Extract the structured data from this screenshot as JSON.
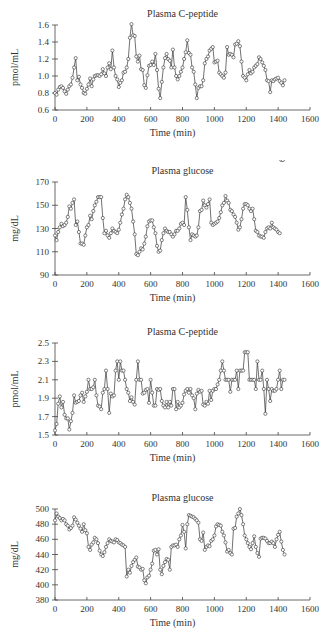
{
  "chart_data": [
    {
      "type": "line",
      "title": "Plasma C-peptide",
      "xlabel": "Time (min)",
      "ylabel": "pmol/mL",
      "xlim": [
        0,
        1600
      ],
      "ylim": [
        0.6,
        1.6
      ],
      "xticks": [
        0,
        200,
        400,
        600,
        800,
        1000,
        1200,
        1400,
        1600
      ],
      "yticks": [
        0.6,
        0.8,
        1.0,
        1.2,
        1.4,
        1.6
      ],
      "ytick_labels": [
        "0.6",
        "0.8",
        "1.0",
        "1.2",
        "1.4",
        "1.6"
      ],
      "grid": false,
      "marker": "open-circle",
      "x": [
        0,
        10,
        20,
        30,
        40,
        50,
        60,
        70,
        80,
        90,
        100,
        110,
        120,
        130,
        140,
        150,
        160,
        170,
        180,
        190,
        200,
        210,
        220,
        230,
        240,
        250,
        260,
        270,
        280,
        290,
        300,
        310,
        320,
        330,
        340,
        350,
        360,
        370,
        380,
        390,
        400,
        410,
        420,
        430,
        440,
        450,
        460,
        470,
        480,
        490,
        500,
        510,
        520,
        530,
        540,
        550,
        560,
        570,
        580,
        590,
        600,
        610,
        620,
        630,
        640,
        650,
        660,
        670,
        680,
        690,
        700,
        710,
        720,
        730,
        740,
        750,
        760,
        770,
        780,
        790,
        800,
        810,
        820,
        830,
        840,
        850,
        860,
        870,
        880,
        890,
        900,
        910,
        920,
        930,
        940,
        950,
        960,
        970,
        980,
        990,
        1000,
        1010,
        1020,
        1030,
        1040,
        1050,
        1060,
        1070,
        1080,
        1090,
        1100,
        1110,
        1120,
        1130,
        1140,
        1150,
        1160,
        1170,
        1180,
        1190,
        1200,
        1210,
        1220,
        1230,
        1240,
        1250,
        1260,
        1270,
        1280,
        1290,
        1300,
        1310,
        1320,
        1330,
        1340,
        1350,
        1360,
        1370,
        1380,
        1390,
        1400,
        1410,
        1420,
        1430,
        1440
      ],
      "values": [
        0.8,
        0.78,
        0.84,
        0.87,
        0.88,
        0.86,
        0.82,
        0.79,
        0.84,
        0.88,
        0.9,
        0.98,
        1.1,
        1.21,
        0.95,
        0.99,
        0.9,
        0.86,
        0.8,
        0.79,
        0.85,
        0.9,
        0.97,
        0.88,
        0.96,
        1.0,
        1.01,
        1.01,
        1.0,
        1.02,
        1.08,
        1.03,
        1.0,
        1.1,
        1.15,
        1.08,
        1.3,
        1.1,
        1.0,
        0.96,
        0.87,
        0.92,
        0.95,
        1.04,
        1.05,
        1.1,
        1.2,
        1.45,
        1.61,
        1.48,
        1.47,
        1.23,
        1.17,
        1.24,
        1.08,
        1.07,
        0.89,
        0.86,
        1.01,
        1.12,
        1.13,
        1.17,
        1.13,
        1.26,
        1.07,
        0.85,
        0.74,
        0.93,
        1.1,
        1.21,
        1.26,
        1.2,
        1.18,
        1.1,
        1.31,
        1.1,
        1.0,
        0.96,
        1.0,
        1.05,
        1.1,
        1.2,
        1.28,
        1.42,
        1.27,
        1.25,
        1.1,
        1.05,
        0.9,
        0.74,
        0.86,
        0.88,
        0.88,
        0.95,
        1.15,
        1.2,
        1.23,
        1.3,
        1.32,
        1.34,
        1.16,
        1.17,
        1.18,
        1.04,
        1.02,
        1.0,
        0.98,
        1.04,
        1.34,
        1.25,
        1.26,
        1.25,
        1.22,
        1.37,
        1.38,
        1.41,
        1.35,
        1.17,
        1.0,
        0.98,
        0.95,
        1.02,
        1.07,
        1.03,
        1.05,
        1.1,
        1.12,
        1.14,
        1.22,
        1.2,
        1.16,
        1.12,
        1.07,
        0.95,
        0.94,
        0.81,
        0.95,
        0.94,
        0.96,
        0.97,
        0.98,
        0.94,
        0.92,
        0.89,
        0.95
      ]
    },
    {
      "type": "line",
      "title": "Plasma glucose",
      "xlabel": "Time (min)",
      "ylabel": "mg/dL",
      "xlim": [
        0,
        1600
      ],
      "ylim": [
        90,
        170
      ],
      "xticks": [
        0,
        200,
        400,
        600,
        800,
        1000,
        1200,
        1400,
        1600
      ],
      "yticks": [
        90,
        110,
        130,
        150,
        170
      ],
      "ytick_labels": [
        "90",
        "110",
        "130",
        "150",
        "170"
      ],
      "grid": false,
      "marker": "open-circle",
      "x": [
        0,
        10,
        20,
        30,
        40,
        50,
        60,
        70,
        80,
        90,
        100,
        110,
        120,
        130,
        140,
        150,
        160,
        170,
        180,
        190,
        200,
        210,
        220,
        230,
        240,
        250,
        260,
        270,
        280,
        290,
        300,
        310,
        320,
        330,
        340,
        350,
        360,
        370,
        380,
        390,
        400,
        410,
        420,
        430,
        440,
        450,
        460,
        470,
        480,
        490,
        500,
        510,
        520,
        530,
        540,
        550,
        560,
        570,
        580,
        590,
        600,
        610,
        620,
        630,
        640,
        650,
        660,
        670,
        680,
        690,
        700,
        710,
        720,
        730,
        740,
        750,
        760,
        770,
        780,
        790,
        800,
        810,
        820,
        830,
        840,
        850,
        860,
        870,
        880,
        890,
        900,
        910,
        920,
        930,
        940,
        950,
        960,
        970,
        980,
        990,
        1000,
        1010,
        1020,
        1030,
        1040,
        1050,
        1060,
        1070,
        1080,
        1090,
        1100,
        1110,
        1120,
        1130,
        1140,
        1150,
        1160,
        1170,
        1180,
        1190,
        1200,
        1210,
        1220,
        1230,
        1240,
        1250,
        1260,
        1270,
        1280,
        1290,
        1300,
        1310,
        1320,
        1330,
        1340,
        1350,
        1360,
        1370,
        1380,
        1390,
        1400,
        1410,
        1420,
        1430
      ],
      "values": [
        124,
        120,
        127,
        131,
        134,
        132,
        133,
        135,
        140,
        149,
        147,
        152,
        155,
        133,
        136,
        127,
        117,
        117,
        116,
        124,
        131,
        133,
        141,
        138,
        145,
        150,
        153,
        157,
        157,
        157,
        139,
        126,
        128,
        124,
        122,
        126,
        130,
        128,
        127,
        126,
        129,
        135,
        142,
        147,
        155,
        159,
        157,
        152,
        147,
        136,
        125,
        108,
        107,
        110,
        113,
        112,
        117,
        123,
        132,
        136,
        137,
        137,
        131,
        126,
        115,
        110,
        111,
        120,
        126,
        130,
        128,
        127,
        127,
        125,
        123,
        125,
        128,
        128,
        130,
        134,
        135,
        133,
        157,
        146,
        131,
        120,
        125,
        124,
        123,
        124,
        131,
        145,
        146,
        154,
        150,
        148,
        151,
        155,
        135,
        133,
        134,
        135,
        136,
        139,
        144,
        150,
        152,
        158,
        154,
        152,
        146,
        145,
        142,
        140,
        135,
        129,
        131,
        138,
        147,
        151,
        151,
        150,
        147,
        145,
        147,
        138,
        128,
        127,
        124,
        123,
        123,
        122,
        127,
        130,
        131,
        130,
        135,
        131,
        130,
        129,
        127,
        126
      ]
    },
    {
      "type": "line",
      "title": "Plasma C-peptide",
      "xlabel": "Time (min)",
      "ylabel": "pmol/mL",
      "xlim": [
        0,
        1600
      ],
      "ylim": [
        1.5,
        2.5
      ],
      "xticks": [
        0,
        200,
        400,
        600,
        800,
        1000,
        1200,
        1400,
        1600
      ],
      "yticks": [
        1.5,
        1.7,
        1.9,
        2.1,
        2.3,
        2.5
      ],
      "ytick_labels": [
        "1.5",
        "1.7",
        "1.9",
        "2.1",
        "2.3",
        "2.5"
      ],
      "grid": false,
      "marker": "open-circle",
      "x": [
        0,
        10,
        20,
        30,
        40,
        50,
        60,
        70,
        80,
        90,
        100,
        110,
        120,
        130,
        140,
        150,
        160,
        170,
        180,
        190,
        200,
        210,
        220,
        230,
        240,
        250,
        260,
        270,
        280,
        290,
        300,
        310,
        320,
        330,
        340,
        350,
        360,
        370,
        380,
        390,
        400,
        410,
        420,
        430,
        440,
        450,
        460,
        470,
        480,
        490,
        500,
        510,
        520,
        530,
        540,
        550,
        560,
        570,
        580,
        590,
        600,
        610,
        620,
        630,
        640,
        650,
        660,
        670,
        680,
        690,
        700,
        710,
        720,
        730,
        740,
        750,
        760,
        770,
        780,
        790,
        800,
        810,
        820,
        830,
        840,
        850,
        860,
        870,
        880,
        890,
        900,
        910,
        920,
        930,
        940,
        950,
        960,
        970,
        980,
        990,
        1000,
        1010,
        1020,
        1030,
        1040,
        1050,
        1060,
        1070,
        1080,
        1090,
        1100,
        1110,
        1120,
        1130,
        1140,
        1150,
        1160,
        1170,
        1180,
        1190,
        1200,
        1210,
        1220,
        1230,
        1240,
        1250,
        1260,
        1270,
        1280,
        1290,
        1300,
        1310,
        1320,
        1330,
        1340,
        1350,
        1360,
        1370,
        1380,
        1390,
        1400,
        1410,
        1420,
        1430,
        1440
      ],
      "values": [
        1.55,
        1.62,
        1.84,
        1.92,
        1.8,
        1.86,
        1.72,
        1.68,
        1.68,
        1.56,
        1.65,
        1.74,
        1.93,
        1.85,
        1.86,
        1.87,
        1.93,
        1.96,
        1.86,
        1.92,
        1.97,
        2.1,
        2.0,
        2.0,
        2.02,
        2.1,
        1.93,
        1.82,
        1.81,
        1.78,
        1.96,
        2.0,
        2.2,
        2.0,
        1.74,
        1.95,
        1.92,
        1.93,
        2.2,
        2.3,
        2.1,
        2.3,
        2.2,
        2.2,
        2.1,
        2.0,
        1.96,
        1.87,
        1.91,
        1.86,
        1.83,
        2.1,
        2.3,
        2.1,
        2.1,
        1.95,
        1.96,
        1.99,
        2.0,
        1.85,
        2.1,
        1.96,
        1.82,
        1.82,
        2.0,
        1.99,
        2.0,
        1.87,
        1.82,
        1.8,
        1.86,
        1.8,
        1.86,
        1.82,
        2.0,
        2.0,
        1.78,
        1.86,
        1.8,
        1.82,
        1.85,
        1.94,
        1.98,
        2.0,
        1.96,
        2.0,
        1.93,
        1.9,
        1.78,
        1.95,
        1.99,
        1.97,
        1.98,
        1.83,
        1.82,
        1.86,
        1.84,
        1.98,
        1.88,
        1.98,
        2.0,
        2.0,
        2.05,
        2.1,
        2.2,
        2.3,
        2.2,
        2.1,
        2.1,
        2.1,
        1.97,
        2.1,
        2.1,
        2.1,
        2.2,
        2.0,
        2.2,
        2.2,
        2.2,
        2.4,
        2.4,
        2.4,
        2.1,
        2.1,
        2.1,
        2.1,
        2.0,
        2.3,
        2.1,
        2.1,
        2.2,
        2.0,
        1.73,
        2.1,
        2.0,
        1.87,
        2.0,
        1.98,
        1.98,
        2.0,
        2.1,
        2.2,
        2.0,
        2.1,
        2.1
      ]
    },
    {
      "type": "line",
      "title": "Plasma glucose",
      "xlabel": "Time (min)",
      "ylabel": "mg/dL",
      "xlim": [
        0,
        1600
      ],
      "ylim": [
        380,
        500
      ],
      "xticks": [
        0,
        200,
        400,
        600,
        800,
        1000,
        1200,
        1400,
        1600
      ],
      "yticks": [
        380,
        400,
        420,
        440,
        460,
        480,
        500
      ],
      "ytick_labels": [
        "380",
        "400",
        "420",
        "440",
        "460",
        "480",
        "500"
      ],
      "grid": false,
      "marker": "open-circle",
      "x": [
        0,
        10,
        20,
        30,
        40,
        50,
        60,
        70,
        80,
        90,
        100,
        110,
        120,
        130,
        140,
        150,
        160,
        170,
        180,
        190,
        200,
        210,
        220,
        230,
        240,
        250,
        260,
        270,
        280,
        290,
        300,
        310,
        320,
        330,
        340,
        350,
        360,
        370,
        380,
        390,
        400,
        410,
        420,
        430,
        440,
        450,
        460,
        470,
        480,
        490,
        500,
        510,
        520,
        530,
        540,
        550,
        560,
        570,
        580,
        590,
        600,
        610,
        620,
        630,
        640,
        650,
        660,
        670,
        680,
        690,
        700,
        710,
        720,
        730,
        740,
        750,
        760,
        770,
        780,
        790,
        800,
        810,
        820,
        830,
        840,
        850,
        860,
        870,
        880,
        890,
        900,
        910,
        920,
        930,
        940,
        950,
        960,
        970,
        980,
        990,
        1000,
        1010,
        1020,
        1030,
        1040,
        1050,
        1060,
        1070,
        1080,
        1090,
        1100,
        1110,
        1120,
        1130,
        1140,
        1150,
        1160,
        1170,
        1180,
        1190,
        1200,
        1210,
        1220,
        1230,
        1240,
        1250,
        1260,
        1270,
        1280,
        1290,
        1300,
        1310,
        1320,
        1330,
        1340,
        1350,
        1360,
        1370,
        1380,
        1390,
        1400,
        1410,
        1420,
        1430,
        1440
      ],
      "values": [
        485,
        494,
        490,
        488,
        485,
        487,
        485,
        480,
        478,
        473,
        475,
        478,
        489,
        486,
        482,
        478,
        474,
        470,
        480,
        472,
        468,
        450,
        446,
        453,
        456,
        462,
        460,
        455,
        445,
        440,
        438,
        443,
        450,
        455,
        460,
        458,
        457,
        456,
        460,
        459,
        456,
        455,
        453,
        452,
        450,
        411,
        420,
        416,
        425,
        430,
        433,
        436,
        424,
        423,
        420,
        421,
        406,
        402,
        410,
        412,
        420,
        428,
        445,
        446,
        440,
        447,
        420,
        414,
        425,
        430,
        434,
        433,
        420,
        450,
        452,
        452,
        453,
        450,
        460,
        465,
        479,
        470,
        448,
        480,
        492,
        491,
        490,
        489,
        487,
        485,
        482,
        460,
        458,
        469,
        446,
        450,
        452,
        451,
        458,
        460,
        465,
        477,
        480,
        479,
        478,
        470,
        465,
        456,
        444,
        446,
        442,
        440,
        474,
        475,
        490,
        494,
        500,
        492,
        480,
        465,
        460,
        455,
        450,
        447,
        455,
        464,
        450,
        442,
        437,
        461,
        462,
        462,
        461,
        458,
        455,
        455,
        457,
        455,
        450,
        460,
        466,
        470,
        457,
        446,
        440,
        435,
        445,
        442
      ]
    }
  ]
}
